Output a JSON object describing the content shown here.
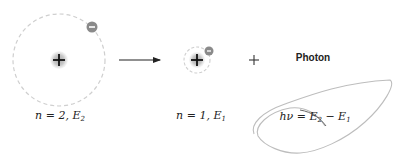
{
  "diagram": {
    "type": "electron-transition-photon-emission",
    "initial_state": {
      "n": "2",
      "energy_symbol": "E",
      "energy_sub": "2",
      "label_prefix": "n = 2, ",
      "nucleus_symbol": "+",
      "electron_symbol": "−"
    },
    "final_state": {
      "n": "1",
      "energy_symbol": "E",
      "energy_sub": "1",
      "label_prefix": "n = 1, ",
      "nucleus_symbol": "+",
      "electron_symbol": "−"
    },
    "operator_plus": "+",
    "photon": {
      "label": "Photon",
      "equation_lhs": "hν = ",
      "equation_e2": "E",
      "equation_e2_sub": "2",
      "equation_minus": " − ",
      "equation_e1": "E",
      "equation_e1_sub": "1"
    },
    "colors": {
      "orbit": "#c8c8c8",
      "nucleus": "#bdbdbd",
      "electron": "#8a8a8a",
      "arrow": "#222222",
      "text": "#222222",
      "wave": "#b5b5b5"
    }
  }
}
